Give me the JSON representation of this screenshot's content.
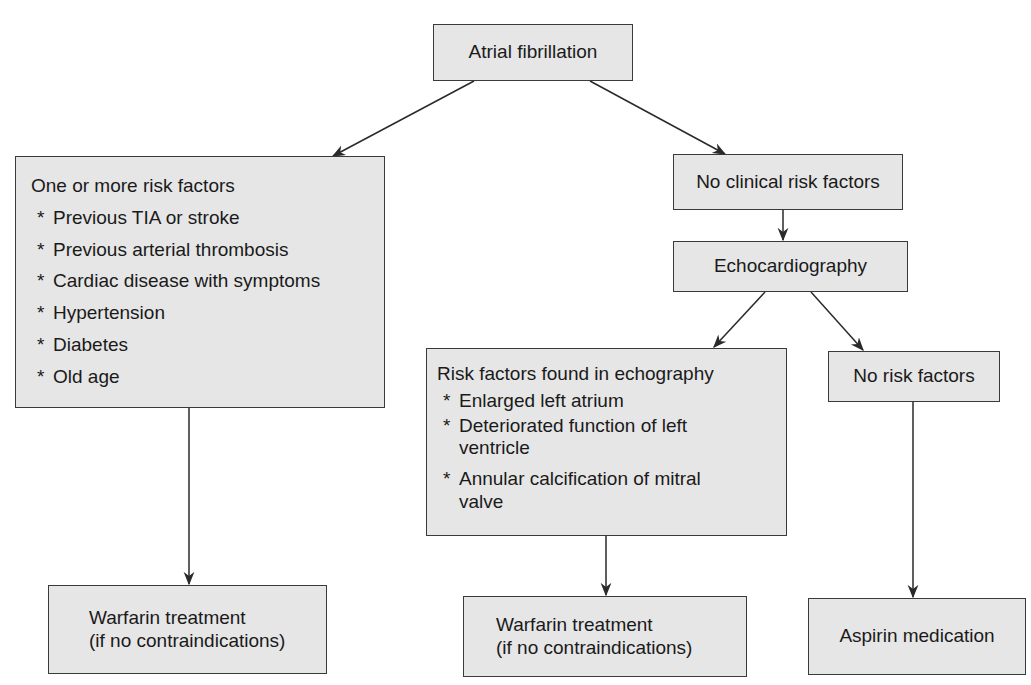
{
  "diagram": {
    "type": "flowchart",
    "nodes": {
      "root": {
        "label": "Atrial fibrillation"
      },
      "risk_factors": {
        "title": "One or more risk factors",
        "items": [
          "Previous TIA or stroke",
          "Previous arterial thrombosis",
          "Cardiac disease with symptoms",
          "Hypertension",
          "Diabetes",
          "Old age"
        ]
      },
      "no_clinical": {
        "label": "No clinical risk factors"
      },
      "echo": {
        "label": "Echocardiography"
      },
      "echo_risk": {
        "title": "Risk factors found in echography",
        "items": [
          "Enlarged left atrium",
          "Deteriorated function of left ventricle",
          "Annular calcification of mitral valve"
        ]
      },
      "no_risk": {
        "label": "No risk factors"
      },
      "warfarin_left": {
        "line1": "Warfarin treatment",
        "line2": "(if no contraindications)"
      },
      "warfarin_mid": {
        "line1": "Warfarin treatment",
        "line2": "(if no contraindications)"
      },
      "aspirin": {
        "label": "Aspirin medication"
      }
    },
    "edges": [
      [
        "root",
        "risk_factors"
      ],
      [
        "root",
        "no_clinical"
      ],
      [
        "no_clinical",
        "echo"
      ],
      [
        "echo",
        "echo_risk"
      ],
      [
        "echo",
        "no_risk"
      ],
      [
        "risk_factors",
        "warfarin_left"
      ],
      [
        "echo_risk",
        "warfarin_mid"
      ],
      [
        "no_risk",
        "aspirin"
      ]
    ],
    "colors": {
      "box_fill": "#e6e6e6",
      "box_border": "#3a3a3a",
      "line": "#2a2a2a"
    }
  }
}
